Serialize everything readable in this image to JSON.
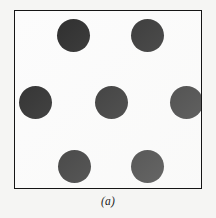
{
  "figure": {
    "caption": "(a)",
    "background_color": "#f5f5f3",
    "panel_background_color": "#fcfcfc",
    "border_color": "#151515"
  },
  "chart_data": {
    "type": "scatter",
    "title": "",
    "subtitle": "",
    "xlabel": "",
    "ylabel": "",
    "caption": "(a)",
    "grid": false,
    "legend": null,
    "marker": {
      "shape": "circle",
      "color": "#262626",
      "diameter_px": 33
    },
    "panel": {
      "left_px": 14,
      "top_px": 10,
      "width_px": 188,
      "height_px": 179,
      "border_px": 1.4
    },
    "point_count": 7,
    "xlim": [
      0,
      188
    ],
    "ylim": [
      0,
      179
    ],
    "points": [
      {
        "id": "top-left",
        "cx": 58,
        "cy": 24,
        "r": 16.5
      },
      {
        "id": "top-right",
        "cx": 132,
        "cy": 24,
        "r": 16.5
      },
      {
        "id": "mid-left",
        "cx": 20,
        "cy": 91,
        "r": 16.5
      },
      {
        "id": "mid-center",
        "cx": 96,
        "cy": 91,
        "r": 16.5
      },
      {
        "id": "mid-right",
        "cx": 171,
        "cy": 91,
        "r": 16.5
      },
      {
        "id": "bottom-left",
        "cx": 59,
        "cy": 155,
        "r": 16.5
      },
      {
        "id": "bottom-right",
        "cx": 132,
        "cy": 155,
        "r": 16.5
      }
    ]
  }
}
